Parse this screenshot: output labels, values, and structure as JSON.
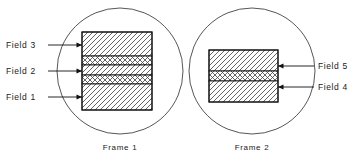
{
  "diagram": {
    "background_color": "#ffffff",
    "line_color": "#111111",
    "circle_stroke_color": "#2b2b2b",
    "hatch_color": "#4a4a4a",
    "groups": [
      {
        "id": "frame-1",
        "caption": "Frame 1",
        "circle": {
          "cx": 120,
          "cy": 71,
          "r": 63
        },
        "caption_pos": {
          "x": 120,
          "y": 150
        },
        "rect": {
          "x": 82,
          "y": 32,
          "w": 70,
          "h": 78
        },
        "bands": [
          {
            "id": "f1-band-1",
            "pattern": "diagonal-up",
            "y": 32,
            "h": 24
          },
          {
            "id": "f1-band-2",
            "pattern": "checker",
            "y": 56,
            "h": 9
          },
          {
            "id": "f1-band-3",
            "pattern": "diagonal-up",
            "y": 65,
            "h": 10
          },
          {
            "id": "f1-band-4",
            "pattern": "checker",
            "y": 75,
            "h": 9
          },
          {
            "id": "f1-band-5",
            "pattern": "diagonal-up",
            "y": 84,
            "h": 26
          }
        ],
        "labels": [
          {
            "text": "Field 3",
            "text_x": 6,
            "text_y": 48,
            "line_y": 45,
            "line_x1": 48,
            "line_x2": 82,
            "side": "left"
          },
          {
            "text": "Field 2",
            "text_x": 6,
            "text_y": 74,
            "line_y": 71,
            "line_x1": 48,
            "line_x2": 82,
            "side": "left"
          },
          {
            "text": "Field 1",
            "text_x": 6,
            "text_y": 100,
            "line_y": 97,
            "line_x1": 48,
            "line_x2": 82,
            "side": "left"
          }
        ]
      },
      {
        "id": "frame-2",
        "caption": "Frame 2",
        "circle": {
          "cx": 252,
          "cy": 71,
          "r": 63
        },
        "caption_pos": {
          "x": 252,
          "y": 150
        },
        "rect": {
          "x": 209,
          "y": 50,
          "w": 69,
          "h": 52
        },
        "bands": [
          {
            "id": "f2-band-1",
            "pattern": "diagonal-up",
            "y": 50,
            "h": 21
          },
          {
            "id": "f2-band-2",
            "pattern": "checker",
            "y": 71,
            "h": 10
          },
          {
            "id": "f2-band-3",
            "pattern": "diagonal-up",
            "y": 81,
            "h": 21
          }
        ],
        "labels": [
          {
            "text": "Field 5",
            "text_x": 318,
            "text_y": 69,
            "line_y": 66,
            "line_x1": 278,
            "line_x2": 314,
            "side": "right"
          },
          {
            "text": "Field 4",
            "text_x": 318,
            "text_y": 90,
            "line_y": 87,
            "line_x1": 278,
            "line_x2": 314,
            "side": "right"
          }
        ]
      }
    ]
  }
}
